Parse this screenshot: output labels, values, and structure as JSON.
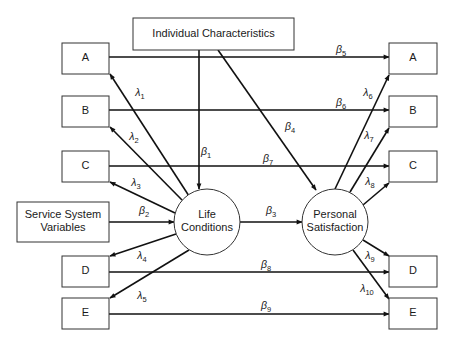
{
  "diagram": {
    "type": "path-diagram",
    "nodes": [
      {
        "id": "ic",
        "label": [
          "Individual Characteristics"
        ],
        "shape": "rect"
      },
      {
        "id": "ssv",
        "label": [
          "Service System",
          "Variables"
        ],
        "shape": "rect"
      },
      {
        "id": "lc",
        "label": [
          "Life",
          "Conditions"
        ],
        "shape": "circle"
      },
      {
        "id": "ps",
        "label": [
          "Personal",
          "Satisfaction"
        ],
        "shape": "circle"
      },
      {
        "id": "la",
        "label": [
          "A"
        ],
        "shape": "rect"
      },
      {
        "id": "lb",
        "label": [
          "B"
        ],
        "shape": "rect"
      },
      {
        "id": "lcc",
        "label": [
          "C"
        ],
        "shape": "rect"
      },
      {
        "id": "ld",
        "label": [
          "D"
        ],
        "shape": "rect"
      },
      {
        "id": "le",
        "label": [
          "E"
        ],
        "shape": "rect"
      },
      {
        "id": "ra",
        "label": [
          "A"
        ],
        "shape": "rect"
      },
      {
        "id": "rb",
        "label": [
          "B"
        ],
        "shape": "rect"
      },
      {
        "id": "rc",
        "label": [
          "C"
        ],
        "shape": "rect"
      },
      {
        "id": "rd",
        "label": [
          "D"
        ],
        "shape": "rect"
      },
      {
        "id": "re",
        "label": [
          "E"
        ],
        "shape": "rect"
      }
    ],
    "edges": [
      {
        "from": "ic",
        "to": "lc",
        "symbol": "β",
        "sub": "1"
      },
      {
        "from": "ssv",
        "to": "lc",
        "symbol": "β",
        "sub": "2"
      },
      {
        "from": "lc",
        "to": "ps",
        "symbol": "β",
        "sub": "3"
      },
      {
        "from": "ic",
        "to": "ps",
        "symbol": "β",
        "sub": "4"
      },
      {
        "from": "la",
        "to": "ra",
        "symbol": "β",
        "sub": "5"
      },
      {
        "from": "lb",
        "to": "rb",
        "symbol": "β",
        "sub": "6"
      },
      {
        "from": "lcc",
        "to": "rc",
        "symbol": "β",
        "sub": "7"
      },
      {
        "from": "ld",
        "to": "rd",
        "symbol": "β",
        "sub": "8"
      },
      {
        "from": "le",
        "to": "re",
        "symbol": "β",
        "sub": "9"
      },
      {
        "from": "lc",
        "to": "la",
        "symbol": "λ",
        "sub": "1"
      },
      {
        "from": "lc",
        "to": "lb",
        "symbol": "λ",
        "sub": "2"
      },
      {
        "from": "lc",
        "to": "lcc",
        "symbol": "λ",
        "sub": "3"
      },
      {
        "from": "lc",
        "to": "ld",
        "symbol": "λ",
        "sub": "4"
      },
      {
        "from": "lc",
        "to": "le",
        "symbol": "λ",
        "sub": "5"
      },
      {
        "from": "ps",
        "to": "ra",
        "symbol": "λ",
        "sub": "6"
      },
      {
        "from": "ps",
        "to": "rb",
        "symbol": "λ",
        "sub": "7"
      },
      {
        "from": "ps",
        "to": "rc",
        "symbol": "λ",
        "sub": "8"
      },
      {
        "from": "ps",
        "to": "rd",
        "symbol": "λ",
        "sub": "9"
      },
      {
        "from": "ps",
        "to": "re",
        "symbol": "λ",
        "sub": "10"
      }
    ]
  }
}
